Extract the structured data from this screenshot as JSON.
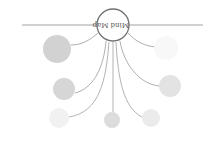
{
  "diagram": {
    "type": "mind-map",
    "orientation": "rotated-180",
    "center": {
      "label": "Mind Map",
      "cx": 113,
      "cy": 25,
      "r": 16,
      "stroke": "#707070",
      "fill": "#ffffff"
    },
    "axis_line": {
      "x1": 22,
      "y1": 25,
      "x2": 203,
      "y2": 25,
      "stroke": "#8a8a8a"
    },
    "nodes": [
      {
        "id": "node-left-top",
        "cx": 57,
        "cy": 49,
        "r": 14,
        "fill": "#d2d2d2"
      },
      {
        "id": "node-right-top",
        "cx": 166,
        "cy": 48,
        "r": 12,
        "fill": "#f8f8f8"
      },
      {
        "id": "node-left-mid",
        "cx": 64,
        "cy": 89,
        "r": 11,
        "fill": "#d6d6d6"
      },
      {
        "id": "node-right-mid",
        "cx": 170,
        "cy": 86,
        "r": 11,
        "fill": "#e3e3e3"
      },
      {
        "id": "node-left-bottom",
        "cx": 59,
        "cy": 118,
        "r": 10,
        "fill": "#f1f1f1"
      },
      {
        "id": "node-bottom-center",
        "cx": 112,
        "cy": 120,
        "r": 8,
        "fill": "#dcdcdc"
      },
      {
        "id": "node-right-bottom",
        "cx": 151,
        "cy": 118,
        "r": 9,
        "fill": "#ebebeb"
      }
    ],
    "connectors": [
      {
        "d": "M98,33 C90,40 82,45 71,45",
        "stroke": "#9a9a9a"
      },
      {
        "d": "M128,33 C136,42 145,46 156,47",
        "stroke": "#9a9a9a"
      },
      {
        "d": "M106,41 C104,65 95,88 75,93",
        "stroke": "#9a9a9a"
      },
      {
        "d": "M120,41 C124,65 140,84 159,86",
        "stroke": "#9a9a9a"
      },
      {
        "d": "M109,42 C106,80 100,112 69,117",
        "stroke": "#a0a0a0"
      },
      {
        "d": "M113,42 L113,112",
        "stroke": "#a0a0a0"
      },
      {
        "d": "M116,42 C118,80 124,108 142,117",
        "stroke": "#a0a0a0"
      }
    ]
  }
}
